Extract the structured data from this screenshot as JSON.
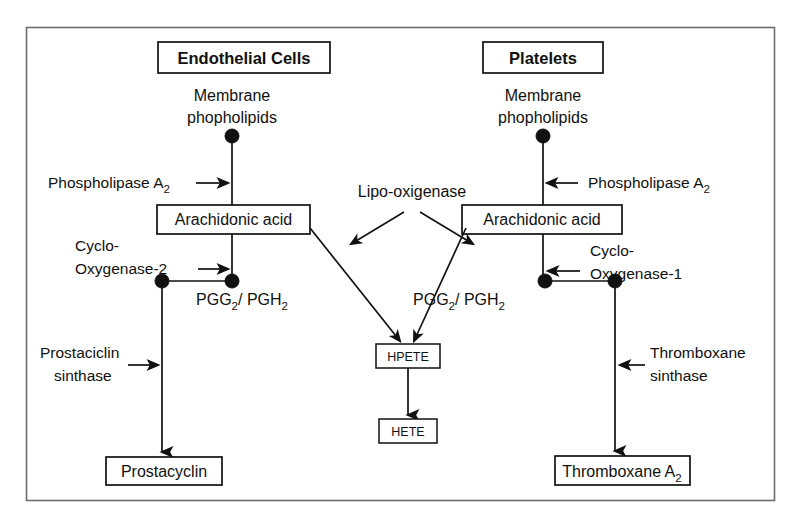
{
  "figure": {
    "border_color": "#6b6b6b",
    "line_color": "#111111",
    "background": "#ffffff"
  },
  "columns": {
    "left": {
      "header": "Endothelial Cells",
      "substrate_line1": "Membrane",
      "substrate_line2": "phopholipids",
      "enzyme1": "Phospholipase A",
      "enzyme1_sub": "2",
      "intermediate_box": "Arachidonic acid",
      "enzyme2_line1": "Cyclo-",
      "enzyme2_line2": "Oxygenase-2",
      "endoperoxide_a": "PGG",
      "endoperoxide_a_sub": "2",
      "endoperoxide_sep": "/ PGH",
      "endoperoxide_b_sub": "2",
      "enzyme3_line1": "Prostaciclin",
      "enzyme3_line2": "sinthase",
      "product_box": "Prostacyclin",
      "arrow_direction": "right"
    },
    "right": {
      "header": "Platelets",
      "substrate_line1": "Membrane",
      "substrate_line2": "phopholipids",
      "enzyme1": "Phospholipase A",
      "enzyme1_sub": "2",
      "intermediate_box": "Arachidonic acid",
      "enzyme2_line1": "Cyclo-",
      "enzyme2_line2": "Oxygenase-1",
      "endoperoxide_a": "PGG",
      "endoperoxide_a_sub": "2",
      "endoperoxide_sep": "/ PGH",
      "endoperoxide_b_sub": "2",
      "enzyme3_line1": "Thromboxane",
      "enzyme3_line2": "sinthase",
      "product_box": "Thromboxane A",
      "product_box_sub": "2",
      "arrow_direction": "left"
    }
  },
  "center": {
    "enzyme": "Lipo-oxigenase",
    "node1": "HPETE",
    "node2": "HETE"
  }
}
